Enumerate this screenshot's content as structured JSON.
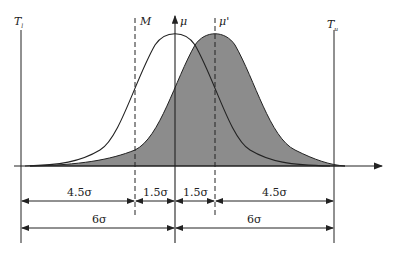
{
  "diagram": {
    "title": "",
    "labels": {
      "lower_limit": "T",
      "lower_limit_sub": "l",
      "upper_limit": "T",
      "upper_limit_sub": "u",
      "tolerance_center": "M",
      "mean": "μ",
      "shifted_mean": "μ'"
    },
    "dimensions": {
      "row1": [
        "4.5σ",
        "1.5σ",
        "1.5σ",
        "4.5σ"
      ],
      "row2": [
        "6σ",
        "6σ"
      ]
    },
    "colors": {
      "shaded_distribution": "#8c8c8c",
      "lines": "#222222"
    }
  }
}
